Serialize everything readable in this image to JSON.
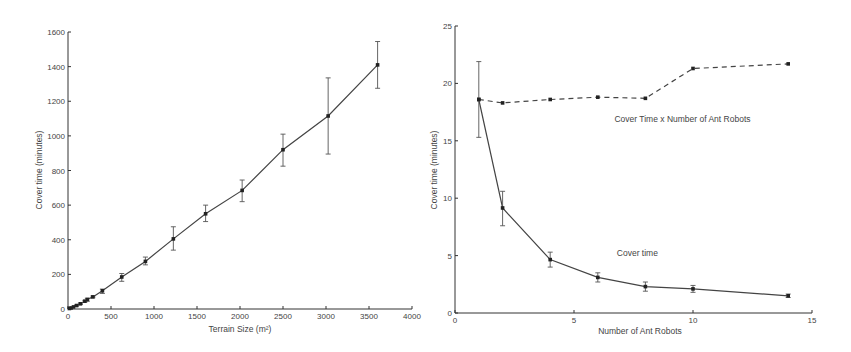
{
  "chart_data": [
    {
      "type": "line",
      "title": "",
      "xlabel": "Terrain Size (m²)",
      "ylabel": "Cover time (minutes)",
      "xlim": [
        0,
        4000
      ],
      "ylim": [
        0,
        1600
      ],
      "xticks": [
        0,
        500,
        1000,
        1500,
        2000,
        2500,
        3000,
        3500,
        4000
      ],
      "yticks": [
        0,
        200,
        400,
        600,
        800,
        1000,
        1200,
        1400,
        1600
      ],
      "grid": false,
      "series": [
        {
          "name": "Cover time",
          "style": "solid",
          "x": [
            16,
            36,
            64,
            100,
            144,
            196,
            225,
            289,
            400,
            625,
            900,
            1225,
            1600,
            2025,
            2500,
            3025,
            3600
          ],
          "values": [
            3,
            6,
            12,
            20,
            30,
            45,
            55,
            70,
            105,
            185,
            275,
            405,
            550,
            685,
            920,
            1115,
            1410
          ],
          "err_low": [
            2,
            5,
            10,
            17,
            26,
            40,
            45,
            65,
            90,
            160,
            255,
            340,
            505,
            620,
            825,
            895,
            1275
          ],
          "err_high": [
            4,
            7,
            14,
            23,
            34,
            50,
            62,
            75,
            115,
            205,
            300,
            475,
            600,
            745,
            1010,
            1335,
            1545
          ]
        }
      ]
    },
    {
      "type": "line",
      "title": "",
      "xlabel": "Number of Ant Robots",
      "ylabel": "Cover time (minutes)",
      "xlim": [
        0,
        15
      ],
      "ylim": [
        0,
        25
      ],
      "xticks": [
        0,
        5,
        10,
        15
      ],
      "yticks": [
        0,
        5,
        10,
        15,
        20,
        25
      ],
      "grid": false,
      "annotations": [
        {
          "text": "Cover Time x Number of Ant Robots",
          "x": 6.7,
          "y": 16.6
        },
        {
          "text": "Cover time",
          "x": 6.8,
          "y": 5.0
        }
      ],
      "series": [
        {
          "name": "Cover Time x Number of Ant Robots",
          "style": "dashed",
          "x": [
            1,
            2,
            4,
            6,
            8,
            10,
            14
          ],
          "values": [
            18.6,
            18.3,
            18.6,
            18.8,
            18.7,
            21.3,
            21.7
          ]
        },
        {
          "name": "Cover time",
          "style": "solid",
          "x": [
            1,
            2,
            4,
            6,
            8,
            10,
            14
          ],
          "values": [
            18.6,
            9.15,
            4.65,
            3.1,
            2.3,
            2.1,
            1.5
          ],
          "err_low": [
            15.3,
            7.6,
            4.0,
            2.7,
            1.9,
            1.8,
            1.35
          ],
          "err_high": [
            21.9,
            10.6,
            5.3,
            3.5,
            2.7,
            2.4,
            1.65
          ]
        }
      ]
    }
  ]
}
